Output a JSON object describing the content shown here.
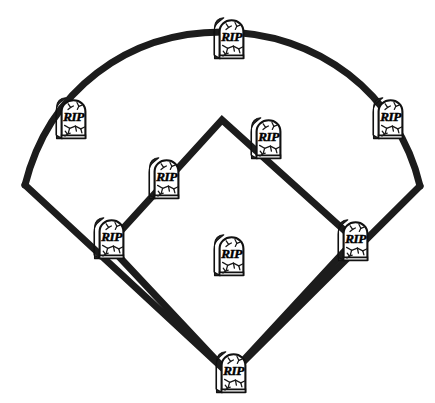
{
  "illustration": {
    "title": "Baseball diamond with tombstones at every position",
    "subject": "baseball-field",
    "style": "black-and-white line art clipart",
    "canvas": {
      "width": 435,
      "height": 403
    },
    "colors": {
      "background": "#ffffff",
      "line": "#1c1c1c",
      "stone_face": "#ffffff",
      "stone_outline": "#141414",
      "stone_side_shadow": "#262626",
      "crack": "#1a1a1a",
      "text": "#000000"
    },
    "field": {
      "line_width": 7,
      "outfield_arc": {
        "label": "outfield-fence-arc",
        "left_corner": {
          "x": 25,
          "y": 185
        },
        "apex": {
          "x": 222,
          "y": 32
        },
        "right_corner": {
          "x": 420,
          "y": 186
        }
      },
      "foul_lines": {
        "label": "foul-lines",
        "home_plate": {
          "x": 230,
          "y": 375
        },
        "left_field_corner": {
          "x": 25,
          "y": 185
        },
        "right_field_corner": {
          "x": 420,
          "y": 186
        }
      },
      "infield_diamond": {
        "label": "infield-base-path-diamond",
        "home": {
          "x": 230,
          "y": 375
        },
        "first_base": {
          "x": 355,
          "y": 240
        },
        "second_base": {
          "x": 222,
          "y": 120
        },
        "third_base": {
          "x": 108,
          "y": 245
        }
      }
    },
    "tombstone": {
      "epitaph": "RIP",
      "shape": "rounded-top-headstone",
      "has_side_panel": true,
      "has_cracks": true
    },
    "tombstones": [
      {
        "id": "center-field",
        "name": "tombstone-center-field",
        "label": "RIP",
        "x": 228,
        "y": 38,
        "w": 34,
        "h": 42,
        "position": "Center Field"
      },
      {
        "id": "left-field",
        "name": "tombstone-left-field",
        "label": "RIP",
        "x": 70,
        "y": 118,
        "w": 34,
        "h": 42,
        "position": "Left Field"
      },
      {
        "id": "right-field",
        "name": "tombstone-right-field",
        "label": "RIP",
        "x": 387,
        "y": 118,
        "w": 34,
        "h": 42,
        "position": "Right Field"
      },
      {
        "id": "second-base",
        "name": "tombstone-second-base",
        "label": "RIP",
        "x": 265,
        "y": 138,
        "w": 34,
        "h": 42,
        "position": "Second Base"
      },
      {
        "id": "shortstop",
        "name": "tombstone-shortstop",
        "label": "RIP",
        "x": 163,
        "y": 178,
        "w": 34,
        "h": 42,
        "position": "Shortstop"
      },
      {
        "id": "third-base",
        "name": "tombstone-third-base",
        "label": "RIP",
        "x": 108,
        "y": 238,
        "w": 34,
        "h": 42,
        "position": "Third Base"
      },
      {
        "id": "first-base",
        "name": "tombstone-first-base",
        "label": "RIP",
        "x": 352,
        "y": 240,
        "w": 34,
        "h": 42,
        "position": "First Base"
      },
      {
        "id": "pitchers-mound",
        "name": "tombstone-pitchers-mound",
        "label": "RIP",
        "x": 228,
        "y": 255,
        "w": 34,
        "h": 42,
        "position": "Pitcher's Mound"
      },
      {
        "id": "home-plate",
        "name": "tombstone-home-plate",
        "label": "RIP",
        "x": 230,
        "y": 372,
        "w": 34,
        "h": 42,
        "position": "Home Plate"
      }
    ]
  }
}
